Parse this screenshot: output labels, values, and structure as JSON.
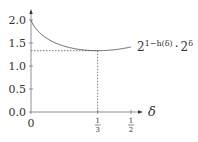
{
  "chart_data": {
    "type": "line",
    "title": "",
    "xlabel": "δ",
    "ylabel": "",
    "xlim": [
      0,
      0.5
    ],
    "ylim": [
      0.0,
      2.0
    ],
    "x_ticks": [
      {
        "value": 0,
        "label": "0"
      },
      {
        "value": 0.3333,
        "label": "1/3",
        "num": "1",
        "den": "3"
      },
      {
        "value": 0.5,
        "label": "1/2",
        "num": "1",
        "den": "2"
      }
    ],
    "y_ticks": [
      {
        "value": 0.0,
        "label": "0.0"
      },
      {
        "value": 0.5,
        "label": "0.5"
      },
      {
        "value": 1.0,
        "label": "1.0"
      },
      {
        "value": 1.5,
        "label": "1.5"
      },
      {
        "value": 2.0,
        "label": "2.0"
      }
    ],
    "grid": false,
    "legend": "none",
    "series": [
      {
        "name": "2^{1−h(δ)} · 2^δ",
        "x": [
          0,
          0.05,
          0.1,
          0.15,
          0.2,
          0.25,
          0.3,
          0.3333,
          0.4,
          0.45,
          0.5
        ],
        "values": [
          2.0,
          1.71,
          1.56,
          1.46,
          1.4,
          1.36,
          1.34,
          1.333,
          1.35,
          1.38,
          1.414
        ]
      }
    ],
    "annotations": [
      {
        "type": "dashed-hline",
        "y": 1.333,
        "x_from": 0,
        "x_to": 0.3333
      },
      {
        "type": "dashed-vline",
        "x": 0.3333,
        "y_from": 0,
        "y_to": 1.333
      },
      {
        "type": "curve-label",
        "text_base1": "2",
        "text_sup1": "1−h(δ)",
        "text_dot": "·",
        "text_base2": "2",
        "text_sup2": "δ"
      }
    ]
  },
  "labels": {
    "xaxis": "δ",
    "x0": "0",
    "x13_num": "1",
    "x13_den": "3",
    "x12_num": "1",
    "x12_den": "2",
    "y0": "0.0",
    "y05": "0.5",
    "y10": "1.0",
    "y15": "1.5",
    "y20": "2.0",
    "curve_base1": "2",
    "curve_sup1": "1−h(δ)",
    "curve_dot": "·",
    "curve_base2": "2",
    "curve_sup2": "δ"
  }
}
